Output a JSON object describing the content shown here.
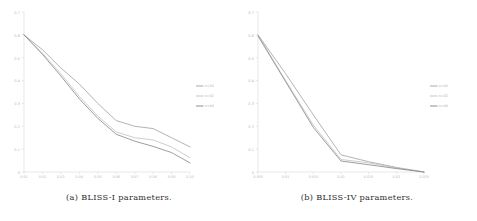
{
  "figure": {
    "panels": [
      {
        "id": "panel-a",
        "caption": "(a) BLISS-I parameters.",
        "legend_position": "right",
        "chart_data": {
          "type": "line",
          "title": "",
          "xlabel": "",
          "ylabel": "",
          "xlim": [
            0.01,
            0.1
          ],
          "ylim": [
            0.0,
            0.7
          ],
          "grid": false,
          "xticks": [
            "0.01",
            "0.02",
            "0.03",
            "0.04",
            "0.05",
            "0.06",
            "0.07",
            "0.08",
            "0.09",
            "0.10"
          ],
          "yticks": [
            "0",
            "0.1",
            "0.2",
            "0.3",
            "0.4",
            "0.5",
            "0.6",
            "0.7"
          ],
          "x": [
            0.01,
            0.02,
            0.03,
            0.04,
            0.05,
            0.06,
            0.07,
            0.08,
            0.09,
            0.1
          ],
          "legend": [
            "n=16",
            "n=32",
            "n=64"
          ],
          "series": [
            {
              "name": "n=16",
              "color": "#9a9a9a",
              "values": [
                0.6,
                0.535,
                0.455,
                0.385,
                0.3,
                0.225,
                0.2,
                0.19,
                0.15,
                0.11
              ]
            },
            {
              "name": "n=32",
              "color": "#bdbdbd",
              "values": [
                0.6,
                0.52,
                0.43,
                0.33,
                0.245,
                0.175,
                0.15,
                0.14,
                0.11,
                0.062
              ]
            },
            {
              "name": "n=64",
              "color": "#7c7c7c",
              "values": [
                0.6,
                0.515,
                0.42,
                0.32,
                0.235,
                0.165,
                0.135,
                0.112,
                0.085,
                0.04
              ]
            }
          ]
        }
      },
      {
        "id": "panel-b",
        "caption": "(b) BLISS-IV parameters.",
        "legend_position": "right",
        "chart_data": {
          "type": "line",
          "title": "",
          "xlabel": "",
          "ylabel": "",
          "xlim": [
            0.005,
            0.035
          ],
          "ylim": [
            0.0,
            0.7
          ],
          "grid": false,
          "xticks": [
            "0.005",
            "0.01",
            "0.015",
            "0.02",
            "0.025",
            "0.03",
            "0.035"
          ],
          "yticks": [
            "0",
            "0.1",
            "0.2",
            "0.3",
            "0.4",
            "0.5",
            "0.6",
            "0.7"
          ],
          "x": [
            0.005,
            0.01,
            0.015,
            0.02,
            0.025,
            0.03,
            0.035
          ],
          "legend": [
            "n=16",
            "n=32",
            "n=64"
          ],
          "series": [
            {
              "name": "n=16",
              "color": "#9a9a9a",
              "values": [
                0.6,
                0.43,
                0.25,
                0.075,
                0.045,
                0.02,
                0.0
              ]
            },
            {
              "name": "n=32",
              "color": "#bdbdbd",
              "values": [
                0.6,
                0.4,
                0.205,
                0.055,
                0.04,
                0.018,
                0.0
              ]
            },
            {
              "name": "n=64",
              "color": "#7c7c7c",
              "values": [
                0.595,
                0.395,
                0.195,
                0.048,
                0.032,
                0.015,
                0.0
              ]
            }
          ]
        }
      }
    ]
  }
}
